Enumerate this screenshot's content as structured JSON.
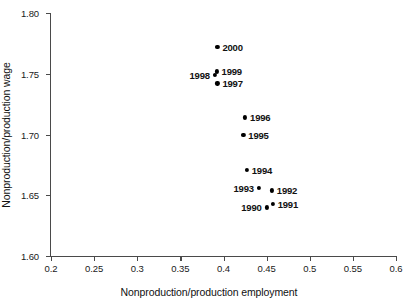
{
  "chart_data": {
    "type": "scatter",
    "title": "",
    "xlabel": "Nonproduction/production employment",
    "ylabel": "Nonproduction/production wage",
    "xlim": [
      0.2,
      0.6
    ],
    "ylim": [
      1.6,
      1.8
    ],
    "xticks": [
      "0.2",
      "0.25",
      "0.3",
      "0.35",
      "0.4",
      "0.45",
      "0.5",
      "0.55",
      "0.6"
    ],
    "xtick_values": [
      0.2,
      0.25,
      0.3,
      0.35,
      0.4,
      0.45,
      0.5,
      0.55,
      0.6
    ],
    "yticks": [
      "1.60",
      "1.65",
      "1.70",
      "1.75",
      "1.80"
    ],
    "ytick_values": [
      1.6,
      1.65,
      1.7,
      1.75,
      1.8
    ],
    "grid": false,
    "legend": false,
    "marker_color": "#000000",
    "axis_color": "#4a4a4a",
    "points": [
      {
        "label": "1990",
        "x": 0.45,
        "y": 1.64,
        "label_side": "left"
      },
      {
        "label": "1991",
        "x": 0.457,
        "y": 1.643,
        "label_side": "right"
      },
      {
        "label": "1992",
        "x": 0.456,
        "y": 1.654,
        "label_side": "right"
      },
      {
        "label": "1993",
        "x": 0.441,
        "y": 1.656,
        "label_side": "left"
      },
      {
        "label": "1994",
        "x": 0.427,
        "y": 1.671,
        "label_side": "right"
      },
      {
        "label": "1995",
        "x": 0.423,
        "y": 1.7,
        "label_side": "right"
      },
      {
        "label": "1996",
        "x": 0.425,
        "y": 1.714,
        "label_side": "right"
      },
      {
        "label": "1997",
        "x": 0.393,
        "y": 1.742,
        "label_side": "right"
      },
      {
        "label": "1998",
        "x": 0.39,
        "y": 1.749,
        "label_side": "left"
      },
      {
        "label": "1999",
        "x": 0.392,
        "y": 1.752,
        "label_side": "right"
      },
      {
        "label": "2000",
        "x": 0.393,
        "y": 1.772,
        "label_side": "right"
      }
    ]
  }
}
